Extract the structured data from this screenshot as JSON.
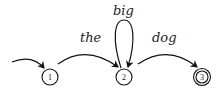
{
  "diagram": {
    "type": "finite-state-automaton",
    "states": [
      {
        "id": "1",
        "label": "1",
        "start": true,
        "accept": false
      },
      {
        "id": "2",
        "label": "2",
        "start": false,
        "accept": false
      },
      {
        "id": "3",
        "label": "3",
        "start": false,
        "accept": true
      }
    ],
    "transitions": [
      {
        "from": "1",
        "to": "2",
        "label": "the"
      },
      {
        "from": "2",
        "to": "2",
        "label": "big"
      },
      {
        "from": "2",
        "to": "3",
        "label": "dog"
      }
    ]
  }
}
